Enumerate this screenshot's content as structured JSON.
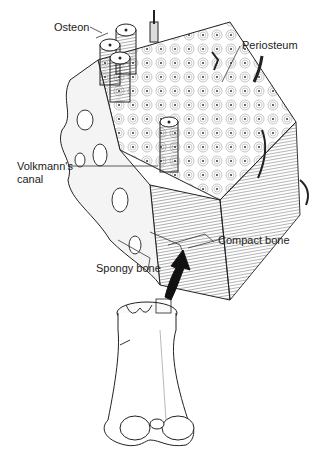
{
  "diagram": {
    "labels": {
      "osteon": "Osteon",
      "periosteum": "Periosteum",
      "volkmann_line1": "Volkmann's",
      "volkmann_line2": "canal",
      "compact_bone": "Compact bone",
      "spongy_bone": "Spongy bone"
    },
    "parts": [
      {
        "id": "bone-section-block",
        "description": "3D cut section of bone tissue"
      },
      {
        "id": "arrow",
        "description": "black curved arrow pointing up from long bone to magnified section"
      },
      {
        "id": "long-bone",
        "description": "distal end of femur with cut-away showing spongy bone and highlighted box"
      }
    ]
  }
}
